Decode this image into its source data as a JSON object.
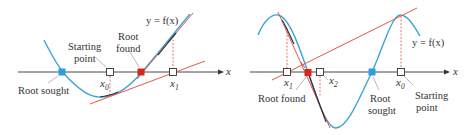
{
  "colors": {
    "curve": "#3aa6d6",
    "tangent": "#e4574a",
    "axis": "#333333",
    "root_sought": "#2e9fd8",
    "root_found": "#d9261c",
    "dashed": "#e4574a",
    "text": "#333333"
  },
  "left_panel": {
    "function_label": "y = f(x)",
    "axis_label": "x",
    "labels": {
      "root_sought": "Root sought",
      "starting_point_line1": "Starting",
      "starting_point_line2": "point",
      "root_found_line1": "Root",
      "root_found_line2": "found"
    },
    "points": [
      {
        "name": "x",
        "subscript": "0"
      },
      {
        "name": "x",
        "subscript": "1"
      }
    ]
  },
  "right_panel": {
    "function_label": "y = f(x)",
    "axis_label": "x",
    "labels": {
      "root_found": "Root found",
      "root_sought_line1": "Root",
      "root_sought_line2": "sought",
      "starting_point_line1": "Starting",
      "starting_point_line2": "point"
    },
    "points": [
      {
        "name": "x",
        "subscript": "1"
      },
      {
        "name": "x",
        "subscript": "2"
      },
      {
        "name": "x",
        "subscript": "0"
      }
    ]
  }
}
